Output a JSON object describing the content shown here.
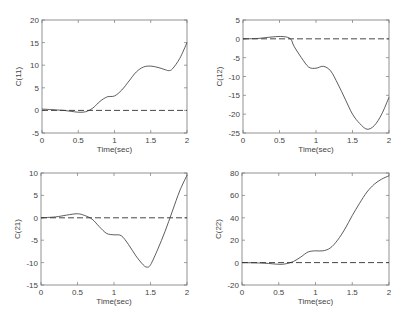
{
  "figure": {
    "width": 405,
    "height": 317,
    "line_color": "#333333",
    "axes_color": "#777777"
  },
  "chart_data": [
    {
      "type": "line",
      "id": "c11",
      "title": "",
      "xlabel": "Time(sec)",
      "ylabel": "C(11)",
      "xlim": [
        0,
        2
      ],
      "ylim": [
        -5,
        20
      ],
      "xticks": [
        0,
        0.5,
        1,
        1.5,
        2
      ],
      "xtick_labels": [
        "0",
        "0.5",
        "1",
        "1.5",
        "2"
      ],
      "yticks": [
        -5,
        0,
        5,
        10,
        15,
        20
      ],
      "ytick_labels": [
        "-5",
        "0",
        "5",
        "10",
        "15",
        "20"
      ],
      "grid": false,
      "box": {
        "left": 42,
        "top": 20,
        "right": 187,
        "bottom": 133
      },
      "series": [
        {
          "name": "solid",
          "style": "solid",
          "x": [
            0,
            0.1,
            0.2,
            0.3,
            0.4,
            0.5,
            0.6,
            0.7,
            0.8,
            0.9,
            1.0,
            1.1,
            1.2,
            1.3,
            1.4,
            1.5,
            1.6,
            1.7,
            1.75,
            1.8,
            1.9,
            2.0
          ],
          "y": [
            0.3,
            0.2,
            0.1,
            0,
            -0.2,
            -0.4,
            -0.3,
            0.5,
            2,
            3,
            3.2,
            4.5,
            6.5,
            8.5,
            9.6,
            9.8,
            9.5,
            9.0,
            8.8,
            9.2,
            11.5,
            15
          ]
        },
        {
          "name": "dashed",
          "style": "dashed",
          "x": [
            0,
            2
          ],
          "y": [
            0,
            0
          ]
        }
      ]
    },
    {
      "type": "line",
      "id": "c12",
      "title": "",
      "xlabel": "Time(sec)",
      "ylabel": "C(12)",
      "xlim": [
        0,
        2
      ],
      "ylim": [
        -25,
        5
      ],
      "xticks": [
        0,
        0.5,
        1,
        1.5,
        2
      ],
      "xtick_labels": [
        "0",
        "0.5",
        "1",
        "1.5",
        "2"
      ],
      "yticks": [
        -25,
        -20,
        -15,
        -10,
        -5,
        0,
        5
      ],
      "ytick_labels": [
        "-25",
        "-20",
        "-15",
        "-10",
        "-5",
        "0",
        "5"
      ],
      "grid": false,
      "box": {
        "left": 243,
        "top": 20,
        "right": 389,
        "bottom": 133
      },
      "series": [
        {
          "name": "solid",
          "style": "solid",
          "x": [
            0,
            0.2,
            0.4,
            0.55,
            0.65,
            0.7,
            0.8,
            0.9,
            1.0,
            1.1,
            1.2,
            1.3,
            1.4,
            1.5,
            1.6,
            1.7,
            1.8,
            1.9,
            2.0
          ],
          "y": [
            0,
            0.1,
            0.5,
            0.6,
            0,
            -2,
            -5,
            -7.5,
            -7.8,
            -7.3,
            -8.5,
            -12,
            -16,
            -20,
            -22.5,
            -24,
            -23,
            -20,
            -15.5
          ]
        },
        {
          "name": "dashed",
          "style": "dashed",
          "x": [
            0,
            2
          ],
          "y": [
            0,
            0
          ]
        }
      ]
    },
    {
      "type": "line",
      "id": "c21",
      "title": "",
      "xlabel": "Time(sec)",
      "ylabel": "C(21)",
      "xlim": [
        0,
        2
      ],
      "ylim": [
        -15,
        10
      ],
      "xticks": [
        0,
        0.5,
        1,
        1.5,
        2
      ],
      "xtick_labels": [
        "0",
        "0.5",
        "1",
        "1.5",
        "2"
      ],
      "yticks": [
        -15,
        -10,
        -5,
        0,
        5,
        10
      ],
      "ytick_labels": [
        "-15",
        "-10",
        "-5",
        "0",
        "5",
        "10"
      ],
      "grid": false,
      "box": {
        "left": 41,
        "top": 173,
        "right": 187,
        "bottom": 285
      },
      "series": [
        {
          "name": "solid",
          "style": "solid",
          "x": [
            0,
            0.2,
            0.35,
            0.5,
            0.6,
            0.7,
            0.8,
            0.9,
            1.0,
            1.1,
            1.2,
            1.3,
            1.4,
            1.45,
            1.5,
            1.6,
            1.7,
            1.8,
            1.9,
            2.0
          ],
          "y": [
            0,
            0.2,
            0.6,
            0.9,
            0.5,
            -0.3,
            -2,
            -3.5,
            -3.8,
            -4,
            -6,
            -8.5,
            -10.5,
            -11,
            -10.5,
            -7,
            -3,
            1.5,
            6,
            9.5
          ]
        },
        {
          "name": "dashed",
          "style": "dashed",
          "x": [
            0,
            2
          ],
          "y": [
            0,
            0
          ]
        }
      ]
    },
    {
      "type": "line",
      "id": "c22",
      "title": "",
      "xlabel": "Time(sec)",
      "ylabel": "C(22)",
      "xlim": [
        0,
        2
      ],
      "ylim": [
        -20,
        80
      ],
      "xticks": [
        0,
        0.5,
        1,
        1.5,
        2
      ],
      "xtick_labels": [
        "0",
        "0.5",
        "1",
        "1.5",
        "2"
      ],
      "yticks": [
        -20,
        0,
        20,
        40,
        60,
        80
      ],
      "ytick_labels": [
        "-20",
        "0",
        "20",
        "40",
        "60",
        "80"
      ],
      "grid": false,
      "box": {
        "left": 242,
        "top": 173,
        "right": 389,
        "bottom": 285
      },
      "series": [
        {
          "name": "solid",
          "style": "solid",
          "x": [
            0,
            0.3,
            0.5,
            0.6,
            0.7,
            0.8,
            0.9,
            1.0,
            1.1,
            1.2,
            1.3,
            1.4,
            1.5,
            1.6,
            1.7,
            1.8,
            1.9,
            2.0
          ],
          "y": [
            0,
            -0.5,
            -1.5,
            -1,
            1,
            5,
            9.5,
            10.5,
            10.5,
            13,
            20,
            30,
            42,
            53,
            63,
            70,
            74.5,
            77.5
          ]
        },
        {
          "name": "dashed",
          "style": "dashed",
          "x": [
            0,
            2
          ],
          "y": [
            0,
            0
          ]
        }
      ]
    }
  ]
}
